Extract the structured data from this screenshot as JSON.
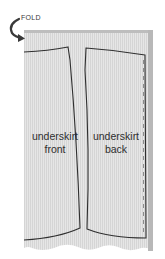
{
  "diagram": {
    "fold_label": "FOLD",
    "pieces": [
      {
        "id": "front",
        "line1": "underskirt",
        "line2": "front"
      },
      {
        "id": "back",
        "line1": "underskirt",
        "line2": "back"
      }
    ],
    "colors": {
      "fabric": "#e4e4e4",
      "fabric_stripe": "#d6d6d6",
      "fabric_top_band": "#bdbdbd",
      "selvage": "#b3b3b3",
      "outline": "#2f2f2f",
      "dashed_line": "#8a8a8a",
      "arrow": "#3a3a3a"
    }
  }
}
